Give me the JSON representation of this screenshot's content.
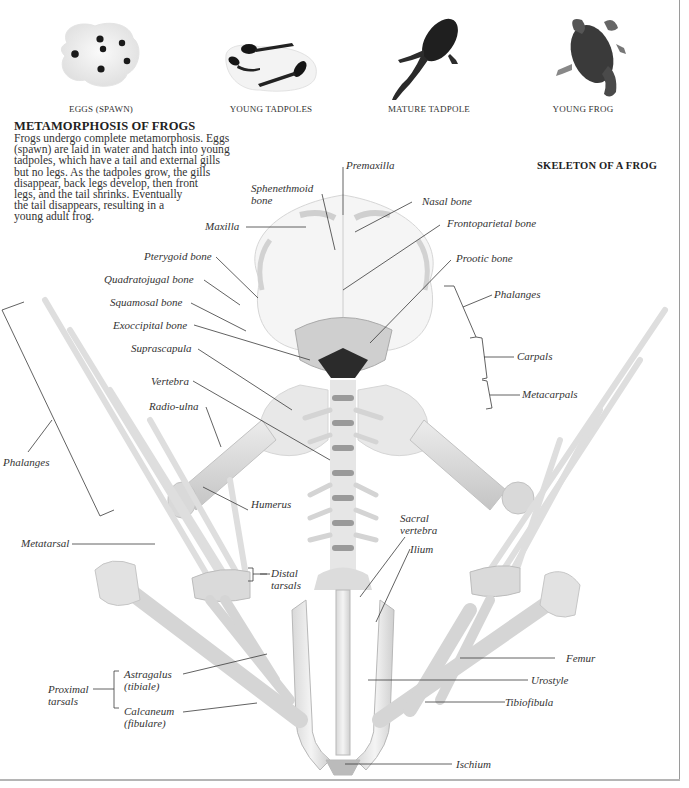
{
  "stages": [
    {
      "id": "eggs",
      "caption": "EGGS (SPAWN)",
      "icon": "frog-eggs-image"
    },
    {
      "id": "young-tadpoles",
      "caption": "YOUNG TADPOLES",
      "icon": "young-tadpoles-image"
    },
    {
      "id": "mature-tadpole",
      "caption": "MATURE TADPOLE",
      "icon": "mature-tadpole-image"
    },
    {
      "id": "young-frog",
      "caption": "YOUNG FROG",
      "icon": "young-frog-image"
    }
  ],
  "intro": {
    "title": "METAMORPHOSIS OF FROGS",
    "lines": [
      "Frogs undergo complete metamorphosis. Eggs",
      "(spawn) are laid in water and hatch into young",
      "tadpoles, which have a tail and external gills",
      "but no legs. As the tadpoles grow, the gills",
      "disappear, back legs develop, then front",
      "legs, and the tail shrinks. Eventually",
      "the tail disappears, resulting in a",
      "young adult frog."
    ]
  },
  "skeleton": {
    "title": "SKELETON OF A FROG",
    "labels": {
      "premaxilla": "Premaxilla",
      "sphenethmoid_1": "Sphenethmoid",
      "sphenethmoid_2": "bone",
      "nasal": "Nasal bone",
      "maxilla": "Maxilla",
      "frontoparietal": "Frontoparietal bone",
      "prootic": "Prootic bone",
      "pterygoid": "Pterygoid bone",
      "quadratojugal": "Quadratojugal bone",
      "squamosal": "Squamosal bone",
      "exoccipital": "Exoccipital bone",
      "suprascapula": "Suprascapula",
      "vertebra": "Vertebra",
      "radio_ulna": "Radio-ulna",
      "phalanges_right": "Phalanges",
      "carpals": "Carpals",
      "metacarpals": "Metacarpals",
      "phalanges_left": "Phalanges",
      "humerus": "Humerus",
      "metatarsal": "Metatarsal",
      "distal_tarsals_1": "Distal",
      "distal_tarsals_2": "tarsals",
      "sacral_vertebra_1": "Sacral",
      "sacral_vertebra_2": "vertebra",
      "ilium": "Ilium",
      "femur": "Femur",
      "urostyle": "Urostyle",
      "tibiofibula": "Tibiofibula",
      "astragalus_1": "Astragalus",
      "astragalus_2": "(tibiale)",
      "proximal_tarsals_1": "Proximal",
      "proximal_tarsals_2": "tarsals",
      "calcaneum_1": "Calcaneum",
      "calcaneum_2": "(fibulare)",
      "ischium": "Ischium"
    }
  },
  "colors": {
    "bone": "#ececec",
    "bone_shade": "#c9c9c9",
    "bone_dark": "#8a8a8a",
    "leader": "#3a3a3a",
    "text": "#333333"
  }
}
